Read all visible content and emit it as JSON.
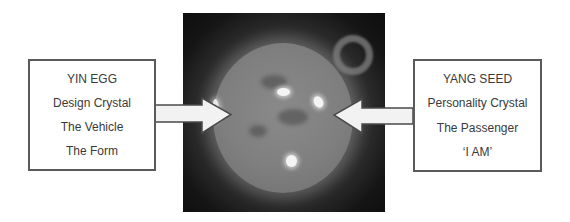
{
  "diagram": {
    "left_box": {
      "lines": [
        "YIN EGG",
        "Design Crystal",
        "The Vehicle",
        "The Form"
      ]
    },
    "right_box": {
      "lines": [
        "YANG SEED",
        "Personality Crystal",
        "The Passenger",
        "‘I AM’"
      ]
    },
    "center_image": {
      "subject": "sun-image"
    },
    "arrows": [
      {
        "from": "left_box",
        "to": "center_image",
        "direction": "right"
      },
      {
        "from": "right_box",
        "to": "center_image",
        "direction": "left"
      }
    ],
    "colors": {
      "box_border": "#5a5a5a",
      "text": "#3a3a3a",
      "arrow_fill": "#f2f2f2",
      "arrow_stroke": "#4a4a4a",
      "image_background": "#111111"
    }
  }
}
